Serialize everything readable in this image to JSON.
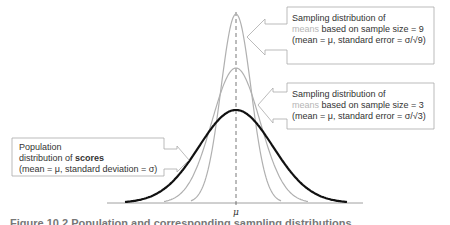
{
  "diagram": {
    "center_label": "μ",
    "curves": [
      {
        "name": "population-scores",
        "color": "#111111",
        "width": 2.2,
        "peak_y": 110,
        "sd_px": 37
      },
      {
        "name": "sampling-means-n3",
        "color": "#b0b0b0",
        "width": 1.2,
        "peak_y": 68,
        "sd_px": 24
      },
      {
        "name": "sampling-means-n9",
        "color": "#b0b0b0",
        "width": 1.2,
        "peak_y": 14,
        "sd_px": 15
      }
    ],
    "callouts": {
      "n9": {
        "line1": "Sampling distribution of",
        "line2_hl": "means",
        "line2_rest": " based on sample size = 9",
        "line3": "(mean = μ, standard error = σ/√9)"
      },
      "n3": {
        "line1": "Sampling distribution of",
        "line2_hl": "means",
        "line2_rest": " based on sample size = 3",
        "line3": "(mean = μ, standard error = σ/√3)"
      },
      "population": {
        "line1": "Population",
        "line2_pre": "distribution of ",
        "line2_hl": "scores",
        "line3": "(mean = μ, standard deviation = σ)"
      }
    },
    "caption": "Figure 10.2  Population and corresponding sampling distributions"
  }
}
